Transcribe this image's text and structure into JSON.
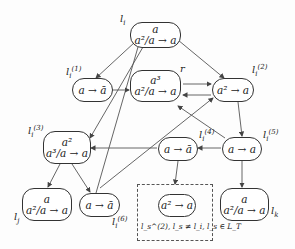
{
  "diagram": {
    "type": "directed-graph",
    "nodes": [
      {
        "id": "l_i",
        "label": "l_i",
        "top": "a",
        "bottom": "a²/a → a"
      },
      {
        "id": "l_i1",
        "label": "l_i^(1)",
        "top": "",
        "bottom": "a → ā"
      },
      {
        "id": "r",
        "label": "r",
        "top": "a³",
        "bottom": "a²/a → a"
      },
      {
        "id": "l_i2",
        "label": "l_i^(2)",
        "top": "",
        "bottom": "a² → a"
      },
      {
        "id": "l_i3",
        "label": "l_i^(3)",
        "top": "a²",
        "bottom": "a³/a → a"
      },
      {
        "id": "l_i4",
        "label": "l_i^(4)",
        "top": "",
        "bottom": "a → ā"
      },
      {
        "id": "l_i5",
        "label": "l_i^(5)",
        "top": "",
        "bottom": "a → a"
      },
      {
        "id": "l_j",
        "label": "l_j",
        "top": "a",
        "bottom": "a²/a → a"
      },
      {
        "id": "l_i6",
        "label": "l_i^(6)",
        "top": "",
        "bottom": "a → ā"
      },
      {
        "id": "l_s2",
        "label": "",
        "top": "",
        "bottom": "a² → a"
      },
      {
        "id": "l_k",
        "label": "l_k",
        "top": "a",
        "bottom": "a²/a → a"
      }
    ],
    "edges": [
      {
        "from": "l_i",
        "to": "l_i1"
      },
      {
        "from": "l_i",
        "to": "l_i2"
      },
      {
        "from": "l_i",
        "to": "l_i6"
      },
      {
        "from": "l_i1",
        "to": "r"
      },
      {
        "from": "r",
        "to": "l_i2"
      },
      {
        "from": "l_i2",
        "to": "r"
      },
      {
        "from": "l_i2",
        "to": "l_i5"
      },
      {
        "from": "l_i5",
        "to": "l_i4"
      },
      {
        "from": "l_i5",
        "to": "r"
      },
      {
        "from": "l_i5",
        "to": "l_k"
      },
      {
        "from": "l_i4",
        "to": "l_i3"
      },
      {
        "from": "l_i4",
        "to": "l_s2"
      },
      {
        "from": "l_i3",
        "to": "l_j"
      },
      {
        "from": "l_i3",
        "to": "l_i6"
      },
      {
        "from": "l_i6",
        "to": "l_i2"
      }
    ],
    "dashed_group": {
      "caption": "l_s^(2), l_s ≠ l_i, l_s ∈ L_T",
      "contains": [
        "l_s2"
      ]
    }
  },
  "text": {
    "l_i_top": "a",
    "l_i_bot": "a²/a → a",
    "l_i1_bot": "a → ā",
    "r_top": "a³",
    "r_bot": "a²/a → a",
    "l_i2_bot": "a² → a",
    "l_i3_top": "a²",
    "l_i3_bot": "a³/a → a",
    "l_i4_bot": "a → ā",
    "l_i5_bot": "a → a",
    "l_j_top": "a",
    "l_j_bot": "a²/a → a",
    "l_i6_bot": "a → ā",
    "l_s2_bot": "a² → a",
    "l_k_top": "a",
    "l_k_bot": "a²/a → a",
    "lbl_li": "l",
    "lbl_li_sub": "i",
    "lbl_r": "r",
    "lbl_lj": "l",
    "lbl_lj_sub": "j",
    "lbl_lk": "l",
    "lbl_lk_sub": "k",
    "sup1": "(1)",
    "sup2": "(2)",
    "sup3": "(3)",
    "sup4": "(4)",
    "sup5": "(5)",
    "sup6": "(6)",
    "caption": "l_s^(2), l_s ≠ l_i, l_s ∈ L_T"
  }
}
